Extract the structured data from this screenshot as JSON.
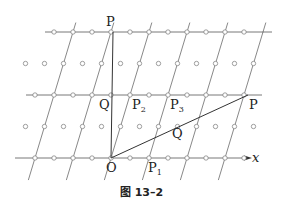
{
  "caption": "图 13–2",
  "axis": {
    "label": "x"
  },
  "labels": {
    "P_top": "P",
    "P_right": "P",
    "Q_mid": "Q",
    "Q_diag": "Q",
    "O": "O",
    "P1": "P",
    "P1_sub": "1",
    "P2": "P",
    "P2_sub": "2",
    "P3": "P",
    "P3_sub": "3"
  },
  "geometry": {
    "origin": [
      111,
      158
    ],
    "rows_y": [
      32,
      63,
      95,
      126,
      158
    ],
    "dot_spacing_x": 19,
    "lattice_line_spacing_x": 38,
    "slant_dx_per_row": 9.5,
    "P_top": [
      113,
      32
    ],
    "P_right": [
      248,
      95
    ]
  }
}
